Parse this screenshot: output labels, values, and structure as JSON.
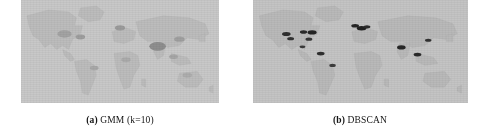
{
  "figure": {
    "type": "two-panel-map-figure",
    "background_color": "#ffffff",
    "subfigures": [
      {
        "id": "a",
        "label": "(a)",
        "title": "GMM (k=10)",
        "caption": "(a) GMM (k=10)",
        "algorithm": "GMM",
        "parameter_label": "k=10",
        "map_projection": "equirectangular-world",
        "ocean_color": "#c8c8c8",
        "land_color": "#bcbcbc",
        "cluster_marker_color": "#7d7d7d",
        "cluster_marker_count": 9,
        "cluster_markers": [
          {
            "name": "north-america-cluster",
            "x": 22,
            "y": 33,
            "r": 3.6,
            "shade": "#a3a3a3"
          },
          {
            "name": "usa-east-cluster",
            "x": 30,
            "y": 36,
            "r": 2.4,
            "shade": "#9e9e9e"
          },
          {
            "name": "south-america-cluster",
            "x": 37,
            "y": 66,
            "r": 2.2,
            "shade": "#a8a8a8"
          },
          {
            "name": "west-europe-cluster",
            "x": 50,
            "y": 27,
            "r": 2.6,
            "shade": "#9b9b9b"
          },
          {
            "name": "africa-cluster",
            "x": 53,
            "y": 58,
            "r": 2.4,
            "shade": "#ababab"
          },
          {
            "name": "india-cluster",
            "x": 69,
            "y": 45,
            "r": 4.2,
            "shade": "#8e8e8e"
          },
          {
            "name": "east-asia-cluster",
            "x": 80,
            "y": 38,
            "r": 2.6,
            "shade": "#a0a0a0"
          },
          {
            "name": "southeast-asia-cluster",
            "x": 77,
            "y": 55,
            "r": 2.2,
            "shade": "#a6a6a6"
          },
          {
            "name": "australia-cluster",
            "x": 84,
            "y": 73,
            "r": 2.4,
            "shade": "#adadad"
          }
        ]
      },
      {
        "id": "b",
        "label": "(b)",
        "title": "DBSCAN",
        "caption": "(b) DBSCAN",
        "algorithm": "DBSCAN",
        "parameter_label": "",
        "map_projection": "equirectangular-world",
        "ocean_color": "#c4c4c4",
        "land_color": "#b9b9b9",
        "cluster_marker_color": "#2a2a2a",
        "cluster_marker_count": 14,
        "cluster_markers": [
          {
            "name": "us-west-cluster",
            "x": 15.5,
            "y": 33.0,
            "r": 2.0,
            "shade": "#2e2e2e"
          },
          {
            "name": "us-southwest-cluster",
            "x": 17.5,
            "y": 37.5,
            "r": 1.6,
            "shade": "#333333"
          },
          {
            "name": "us-midwest-cluster",
            "x": 23.5,
            "y": 31.0,
            "r": 1.7,
            "shade": "#2b2b2b"
          },
          {
            "name": "us-northeast-cluster",
            "x": 27.5,
            "y": 31.5,
            "r": 2.1,
            "shade": "#242424"
          },
          {
            "name": "us-southeast-cluster",
            "x": 26.0,
            "y": 38.0,
            "r": 1.6,
            "shade": "#363636"
          },
          {
            "name": "central-america-cluster",
            "x": 23.0,
            "y": 45.5,
            "r": 1.4,
            "shade": "#3a3a3a"
          },
          {
            "name": "north-south-america-cluster",
            "x": 31.5,
            "y": 52.0,
            "r": 1.8,
            "shade": "#2f2f2f"
          },
          {
            "name": "brazil-cluster",
            "x": 37.0,
            "y": 63.5,
            "r": 1.5,
            "shade": "#3d3d3d"
          },
          {
            "name": "uk-cluster",
            "x": 47.5,
            "y": 25.0,
            "r": 1.8,
            "shade": "#262626"
          },
          {
            "name": "west-europe-cluster",
            "x": 50.5,
            "y": 27.5,
            "r": 2.2,
            "shade": "#222222"
          },
          {
            "name": "central-europe-cluster",
            "x": 53.0,
            "y": 26.0,
            "r": 1.6,
            "shade": "#2d2d2d"
          },
          {
            "name": "india-cluster",
            "x": 69.0,
            "y": 46.0,
            "r": 2.0,
            "shade": "#272727"
          },
          {
            "name": "southeast-asia-cluster",
            "x": 76.5,
            "y": 53.0,
            "r": 1.8,
            "shade": "#2a2a2a"
          },
          {
            "name": "east-asia-cluster",
            "x": 81.5,
            "y": 39.0,
            "r": 1.5,
            "shade": "#313131"
          }
        ]
      }
    ]
  }
}
